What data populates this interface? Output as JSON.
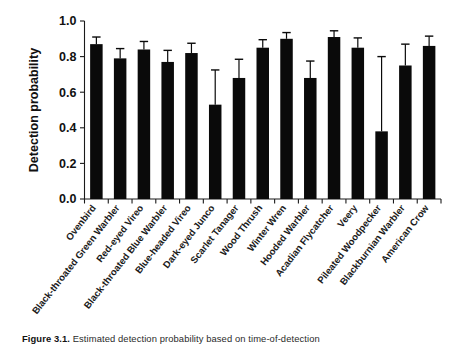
{
  "chart_data": {
    "type": "bar",
    "title": "",
    "xlabel": "",
    "ylabel": "Detection probability",
    "ylim": [
      0.0,
      1.0
    ],
    "yticks": [
      0.0,
      0.2,
      0.4,
      0.6,
      0.8,
      1.0
    ],
    "ytick_labels": [
      "0.0",
      "0.2",
      "0.4",
      "0.6",
      "0.8",
      "1.0"
    ],
    "grid": false,
    "legend": "none",
    "error_bars": "upper only (one-sided whisker with cap)",
    "categories": [
      "Ovenbird",
      "Black-throated Green Warbler",
      "Red-eyed Vireo",
      "Black-throated Blue Warbler",
      "Blue-headed Vireo",
      "Dark-eyed Junco",
      "Scarlet Tanager",
      "Wood Thrush",
      "Winter Wren",
      "Hooded Warbler",
      "Acadian Flycatcher",
      "Veery",
      "Pileated Woodpecker",
      "Blackburnian Warbler",
      "American Crow"
    ],
    "values": [
      0.87,
      0.79,
      0.84,
      0.77,
      0.82,
      0.53,
      0.68,
      0.85,
      0.9,
      0.68,
      0.91,
      0.85,
      0.38,
      0.75,
      0.86
    ],
    "error_upper": [
      0.91,
      0.845,
      0.885,
      0.835,
      0.875,
      0.725,
      0.785,
      0.895,
      0.935,
      0.775,
      0.945,
      0.905,
      0.8,
      0.87,
      0.915
    ],
    "bar_color": "#0a0a0a"
  },
  "caption": {
    "label": "Figure 3.1.",
    "text": "Estimated detection probability based on time-of-detection"
  }
}
